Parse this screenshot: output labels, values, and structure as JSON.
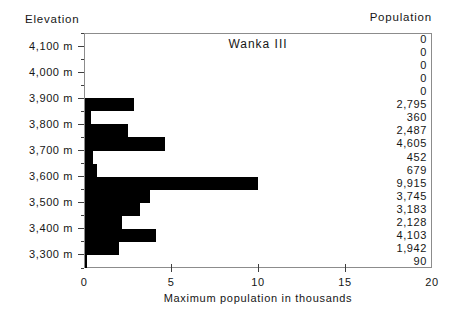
{
  "chart_data": {
    "type": "bar",
    "orientation": "horizontal",
    "title": "Wanka III",
    "ylabel_header": "Elevation",
    "values_header": "Population",
    "xlabel": "Maximum population in thousands",
    "xlim": [
      0,
      20
    ],
    "xtick_labels": [
      0,
      5,
      10,
      15,
      20
    ],
    "xticks_with_marks": [
      5,
      10,
      15
    ],
    "grid": false,
    "legend": false,
    "bar_color": "#000000",
    "background_color": "#ffffff",
    "elevation_axis_labels": [
      "4,100 m",
      "4,000 m",
      "3,900 m",
      "3,800 m",
      "3,700 m",
      "3,600 m",
      "3,500 m",
      "3,400 m",
      "3,300 m"
    ],
    "rows": [
      {
        "population": 0,
        "population_label": "0"
      },
      {
        "population": 0,
        "population_label": "0"
      },
      {
        "population": 0,
        "population_label": "0"
      },
      {
        "population": 0,
        "population_label": "0"
      },
      {
        "population": 0,
        "population_label": "0"
      },
      {
        "population": 2795,
        "population_label": "2,795"
      },
      {
        "population": 360,
        "population_label": "360"
      },
      {
        "population": 2487,
        "population_label": "2,487"
      },
      {
        "population": 4605,
        "population_label": "4,605"
      },
      {
        "population": 452,
        "population_label": "452"
      },
      {
        "population": 679,
        "population_label": "679"
      },
      {
        "population": 9915,
        "population_label": "9,915"
      },
      {
        "population": 3745,
        "population_label": "3,745"
      },
      {
        "population": 3183,
        "population_label": "3,183"
      },
      {
        "population": 2128,
        "population_label": "2,128"
      },
      {
        "population": 4103,
        "population_label": "4,103"
      },
      {
        "population": 1942,
        "population_label": "1,942"
      },
      {
        "population": 90,
        "population_label": "90"
      }
    ]
  }
}
